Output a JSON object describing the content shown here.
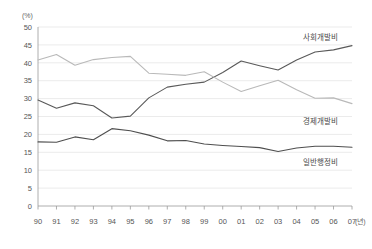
{
  "chart_data": {
    "type": "line",
    "title": "",
    "subtitle": "",
    "xlabel": "(년)",
    "ylabel": "(%)",
    "ylim": [
      0,
      50
    ],
    "ytick_step": 5,
    "yticks": [
      "0",
      "5",
      "10",
      "15",
      "20",
      "25",
      "30",
      "35",
      "40",
      "45",
      "50"
    ],
    "grid": true,
    "legend_position": "inline-right",
    "categories": [
      "90",
      "91",
      "92",
      "93",
      "94",
      "95",
      "96",
      "97",
      "98",
      "99",
      "00",
      "01",
      "02",
      "03",
      "04",
      "05",
      "06",
      "07"
    ],
    "series": [
      {
        "name": "사회개발비",
        "color": "#595959",
        "values": [
          29.6,
          27.3,
          28.8,
          28.0,
          24.6,
          25.1,
          30.2,
          33.2,
          34.0,
          34.6,
          37.3,
          40.5,
          39.2,
          38.0,
          40.8,
          43.0,
          43.6,
          44.8
        ]
      },
      {
        "name": "경제개발비",
        "color": "#b9b9b9",
        "values": [
          40.8,
          42.3,
          39.3,
          40.9,
          41.5,
          41.8,
          37.1,
          36.8,
          36.5,
          37.5,
          34.6,
          32.0,
          33.6,
          35.1,
          32.5,
          30.1,
          30.2,
          28.6
        ]
      },
      {
        "name": "일반행정비",
        "color": "#4f4f4f",
        "values": [
          17.9,
          17.8,
          19.3,
          18.5,
          21.6,
          21.0,
          19.8,
          18.2,
          18.3,
          17.3,
          16.9,
          16.6,
          16.3,
          15.2,
          16.2,
          16.7,
          16.7,
          16.4
        ]
      }
    ],
    "annotations": [
      {
        "text": "사회개발비",
        "x_px": 338,
        "y_px": 40
      },
      {
        "text": "경제개발비",
        "x_px": 338,
        "y_px": 124
      },
      {
        "text": "일반행정비",
        "x_px": 338,
        "y_px": 165
      }
    ]
  },
  "axis": {
    "y_unit": "(%)",
    "x_unit": "(년)"
  }
}
